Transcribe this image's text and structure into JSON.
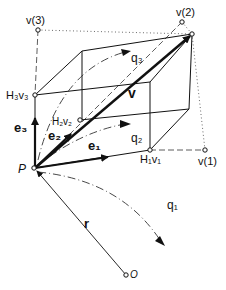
{
  "diagram": {
    "type": "vector-geometry-parallelepiped",
    "labels": {
      "v3_proj": "v(3)",
      "v2_proj": "v(2)",
      "v1_proj": "v(1)",
      "h3v3": "H₃v₃",
      "h2v2": "H₂v₂",
      "h1v1": "H₁v₁",
      "e3": "e₃",
      "e2": "e₂",
      "e1": "e₁",
      "q3": "q₃",
      "q2": "q₂",
      "q1": "q₁",
      "v": "v",
      "r": "r",
      "P": "P",
      "O": "O"
    },
    "points": {
      "P": [
        35,
        168
      ],
      "O": [
        126,
        275
      ],
      "H3v3": [
        35,
        95
      ],
      "H2v2": [
        80,
        120
      ],
      "H1v1": [
        150,
        150
      ],
      "V_tip": [
        192,
        34
      ],
      "v3_proj": [
        38,
        30
      ],
      "v2_proj": [
        182,
        22
      ],
      "v1_proj": [
        205,
        150
      ]
    },
    "colors": {
      "ink": "#111111",
      "background": "#ffffff"
    }
  }
}
